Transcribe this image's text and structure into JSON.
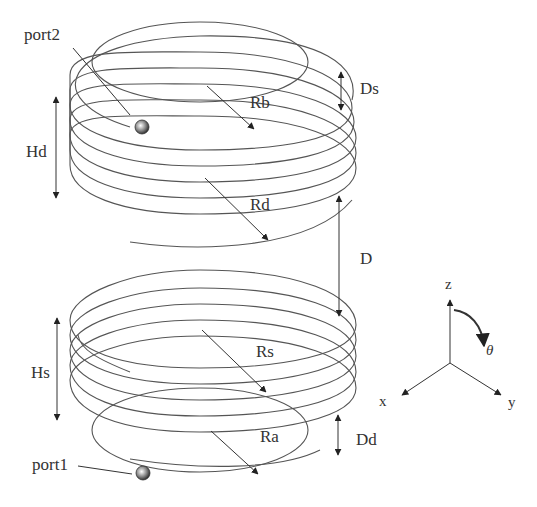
{
  "diagram": {
    "type": "two-coil helical antenna geometry",
    "background": "#ffffff",
    "line_color": "#555555",
    "labels": {
      "port2": "port2",
      "port1": "port1",
      "Hd": "Hd",
      "Hs": "Hs",
      "Rb": "Rb",
      "Rd": "Rd",
      "Rs": "Rs",
      "Ra": "Ra",
      "Ds": "Ds",
      "D": "D",
      "Dd": "Dd"
    },
    "axes": {
      "z": "z",
      "x": "x",
      "y": "y",
      "theta": "θ"
    },
    "upper_coil": {
      "turns": 5,
      "label_height": "Hd",
      "label_radius": "Rd",
      "feed_ring_radius": "Rb",
      "feed_offset": "Ds",
      "port": "port2"
    },
    "lower_coil": {
      "turns": 5,
      "label_height": "Hs",
      "label_radius": "Rs",
      "feed_ring_radius": "Ra",
      "feed_offset": "Dd",
      "port": "port1"
    },
    "separation": "D"
  }
}
